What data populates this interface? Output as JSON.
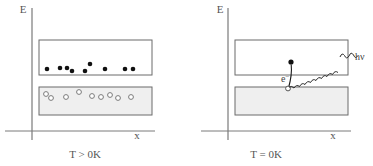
{
  "figure": {
    "width": 373,
    "height": 166,
    "background": "#ffffff",
    "line_color": "#6b6b6b",
    "band_fill_empty": "#ffffff",
    "band_fill_filled": "#efefef",
    "electron_color": "#1a1a1a",
    "hole_color": "#ffffff",
    "hole_stroke": "#777777"
  },
  "panels": [
    {
      "id": "left",
      "name": "thermal-excitation-panel",
      "y_axis_label": "E",
      "x_axis_label": "x",
      "caption": "T > 0K",
      "bands": [
        {
          "name": "conduction-band",
          "x": 39,
          "y": 40,
          "width": 113,
          "height": 35,
          "fill": "#ffffff"
        },
        {
          "name": "valence-band",
          "x": 39,
          "y": 87,
          "width": 113,
          "height": 28,
          "fill": "#efefef"
        }
      ],
      "electrons": [
        {
          "cx": 47,
          "cy": 69,
          "r": 2.3
        },
        {
          "cx": 60,
          "cy": 68,
          "r": 2.3
        },
        {
          "cx": 67,
          "cy": 68,
          "r": 2.3
        },
        {
          "cx": 72,
          "cy": 71,
          "r": 2.3
        },
        {
          "cx": 85,
          "cy": 71,
          "r": 2.3
        },
        {
          "cx": 90,
          "cy": 64,
          "r": 2.3
        },
        {
          "cx": 105,
          "cy": 69,
          "r": 2.3
        },
        {
          "cx": 125,
          "cy": 69,
          "r": 2.3
        },
        {
          "cx": 133,
          "cy": 69,
          "r": 2.3
        }
      ],
      "holes": [
        {
          "cx": 46,
          "cy": 94,
          "r": 2.4
        },
        {
          "cx": 51,
          "cy": 98,
          "r": 2.4
        },
        {
          "cx": 66,
          "cy": 97,
          "r": 2.4
        },
        {
          "cx": 79,
          "cy": 92,
          "r": 2.4
        },
        {
          "cx": 92,
          "cy": 96,
          "r": 2.4
        },
        {
          "cx": 101,
          "cy": 97,
          "r": 2.4
        },
        {
          "cx": 110,
          "cy": 95,
          "r": 2.4
        },
        {
          "cx": 118,
          "cy": 98,
          "r": 2.4
        },
        {
          "cx": 131,
          "cy": 97,
          "r": 2.4
        }
      ],
      "annotations": []
    },
    {
      "id": "right",
      "name": "photon-emission-panel",
      "y_axis_label": "E",
      "x_axis_label": "x",
      "caption": "T = 0K",
      "bands": [
        {
          "name": "conduction-band",
          "x": 235,
          "y": 40,
          "width": 113,
          "height": 35,
          "fill": "#ffffff"
        },
        {
          "name": "valence-band",
          "x": 235,
          "y": 87,
          "width": 113,
          "height": 28,
          "fill": "#efefef"
        }
      ],
      "electrons": [
        {
          "cx": 291,
          "cy": 62,
          "r": 2.6
        }
      ],
      "holes": [
        {
          "cx": 288,
          "cy": 88,
          "r": 2.4
        }
      ],
      "annotations": [
        {
          "name": "electron-label",
          "text": "e",
          "sup": "−",
          "x": 283,
          "y": 81
        },
        {
          "name": "photon-label",
          "text": "hν",
          "x": 356,
          "y": 59
        }
      ]
    }
  ],
  "axes": {
    "left": {
      "vx": 32,
      "vy_top": 8,
      "vy_bottom": 140,
      "hx_start": 5,
      "hx_end": 155,
      "hy": 131
    },
    "right": {
      "vx": 228,
      "vy_top": 8,
      "vy_bottom": 140,
      "hx_start": 201,
      "hx_end": 351,
      "hy": 131
    }
  }
}
